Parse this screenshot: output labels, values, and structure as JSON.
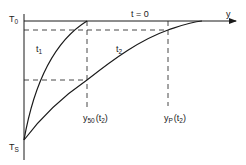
{
  "diagram": {
    "axis_y_label": "y",
    "curve_labels": {
      "t0": "t = 0",
      "t1": "t",
      "t1_sub": "1",
      "t2": "t",
      "t2_sub": "2"
    },
    "temperature_labels": {
      "top": "T",
      "top_sub": "0",
      "bottom": "T",
      "bottom_sub": "S"
    },
    "marker_labels": {
      "y50": "y",
      "y50_sub": "50",
      "y50_arg": "(t",
      "y50_arg_sub": "2",
      "y50_close": ")",
      "yp": "y",
      "yp_sub": "P",
      "yp_arg": "(t",
      "yp_arg_sub": "2",
      "yp_close": ")"
    },
    "colors": {
      "line": "#1a1a1a",
      "background": "#ffffff"
    }
  }
}
